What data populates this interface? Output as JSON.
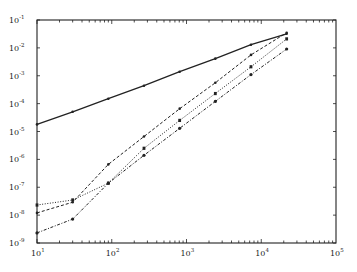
{
  "chart_data": {
    "type": "line",
    "title": "",
    "xlabel": "",
    "ylabel": "",
    "xscale": "log",
    "yscale": "log",
    "xlim": [
      10,
      100000
    ],
    "ylim": [
      1e-09,
      0.1
    ],
    "grid": false,
    "legend": null,
    "x_tick_labels": [
      "10^1",
      "10^2",
      "10^3",
      "10^4",
      "10^5"
    ],
    "y_tick_labels": [
      "10^-1",
      "10^-2",
      "10^-3",
      "10^-4",
      "10^-5",
      "10^-6",
      "10^-7",
      "10^-8",
      "10^-9"
    ],
    "x": [
      10,
      30,
      90,
      270,
      810,
      2430,
      7290,
      21870
    ],
    "series": [
      {
        "name": "solid",
        "style": "solid",
        "marker": "dot",
        "values": [
          1.8e-05,
          5.1e-05,
          0.00015,
          0.00044,
          0.0014,
          0.0041,
          0.013,
          0.032
        ]
      },
      {
        "name": "dashed",
        "style": "dashed",
        "marker": "dot",
        "values": [
          1.2e-08,
          2.9e-08,
          6.6e-07,
          6.6e-06,
          6.6e-05,
          0.00056,
          0.0056,
          0.035
        ]
      },
      {
        "name": "dotted",
        "style": "dotted",
        "marker": "x",
        "values": [
          2.3e-08,
          3.5e-08,
          1.4e-07,
          2.5e-06,
          2.5e-05,
          0.00023,
          0.0021,
          0.021
        ]
      },
      {
        "name": "dash-dot",
        "style": "dashdot",
        "marker": "asterisk",
        "values": [
          2.3e-09,
          7.2e-09,
          1.4e-07,
          1.4e-06,
          1.3e-05,
          0.00012,
          0.0011,
          0.0091
        ]
      }
    ]
  },
  "axes": {
    "x_ticks": [
      {
        "base": "10",
        "exp": "1"
      },
      {
        "base": "10",
        "exp": "2"
      },
      {
        "base": "10",
        "exp": "3"
      },
      {
        "base": "10",
        "exp": "4"
      },
      {
        "base": "10",
        "exp": "5"
      }
    ],
    "y_ticks": [
      {
        "base": "10",
        "exp": "-1"
      },
      {
        "base": "10",
        "exp": "-2"
      },
      {
        "base": "10",
        "exp": "-3"
      },
      {
        "base": "10",
        "exp": "-4"
      },
      {
        "base": "10",
        "exp": "-5"
      },
      {
        "base": "10",
        "exp": "-6"
      },
      {
        "base": "10",
        "exp": "-7"
      },
      {
        "base": "10",
        "exp": "-8"
      },
      {
        "base": "10",
        "exp": "-9"
      }
    ]
  }
}
